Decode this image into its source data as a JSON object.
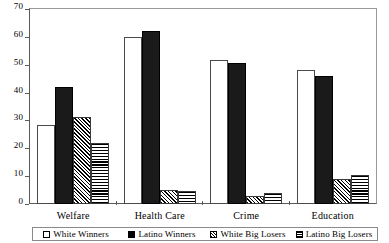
{
  "chart_data": {
    "type": "bar",
    "title": "",
    "xlabel": "",
    "ylabel": "",
    "ylim": [
      0,
      70
    ],
    "yticks": [
      0,
      10,
      20,
      30,
      40,
      50,
      60,
      70
    ],
    "grid": false,
    "legend_position": "bottom",
    "categories": [
      "Welfare",
      "Health Care",
      "Crime",
      "Education"
    ],
    "series": [
      {
        "name": "White Winners",
        "pattern": "open-white",
        "values": [
          28.2,
          60.0,
          51.6,
          48.2
        ]
      },
      {
        "name": "Latino Winners",
        "pattern": "solid-black",
        "values": [
          42.0,
          62.2,
          50.7,
          45.9
        ]
      },
      {
        "name": "White Big Losers",
        "pattern": "diagonal-hatch",
        "values": [
          31.4,
          5.0,
          2.8,
          9.1
        ]
      },
      {
        "name": "Latino Big Losers",
        "pattern": "horizontal-hatch",
        "values": [
          22.0,
          4.8,
          3.8,
          10.5
        ]
      }
    ]
  },
  "colors": {
    "axis": "#5a5a5a",
    "frame": "#9a9a9a",
    "bar_outline": "#000000",
    "solid_fill": "#1a1a1a",
    "background": "#ffffff"
  }
}
